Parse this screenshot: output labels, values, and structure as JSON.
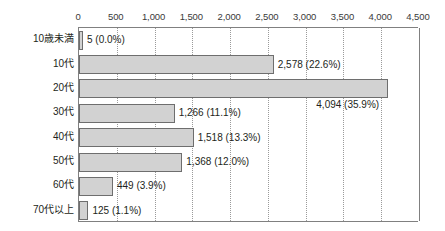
{
  "chart_data": {
    "type": "bar",
    "orientation": "horizontal",
    "title": "",
    "subtitle": "",
    "xlabel": "",
    "ylabel": "",
    "xlim": [
      0,
      4500
    ],
    "xticks": [
      0,
      500,
      1000,
      1500,
      2000,
      2500,
      3000,
      3500,
      4000,
      4500
    ],
    "xtick_labels": [
      "0",
      "500",
      "1,000",
      "1,500",
      "2,000",
      "2,500",
      "3,000",
      "3,500",
      "4,000",
      "4,500"
    ],
    "grid": "vertical-dotted",
    "legend": "none",
    "categories": [
      "10歳未満",
      "10代",
      "20代",
      "30代",
      "40代",
      "50代",
      "60代",
      "70代以上"
    ],
    "values": [
      5,
      2578,
      4094,
      1266,
      1518,
      1368,
      449,
      125
    ],
    "percents": [
      "0.0%",
      "22.6%",
      "35.9%",
      "11.1%",
      "13.3%",
      "12.0%",
      "3.9%",
      "1.1%"
    ],
    "data_labels": [
      "5 (0.0%)",
      "2,578 (22.6%)",
      "4,094 (35.9%)",
      "1,266 (11.1%)",
      "1,518 (13.3%)",
      "1,368 (12.0%)",
      "449 (3.9%)",
      "125 (1.1%)"
    ],
    "data_label_positions": [
      "outside-right",
      "outside-right",
      "below-right",
      "outside-right",
      "outside-right",
      "outside-right",
      "outside-right",
      "outside-right"
    ],
    "colors": {
      "bar_fill": "#d2d2d2",
      "bar_border": "#6e6e6e",
      "axis": "#808080",
      "gridline": "#9a9a9a",
      "text": "#231f20"
    }
  }
}
